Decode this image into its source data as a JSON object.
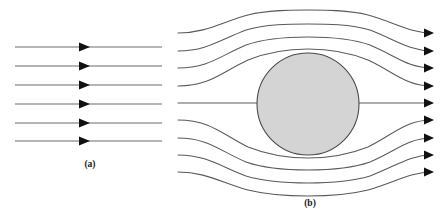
{
  "figure": {
    "background_color": "#ffffff",
    "width": 448,
    "height": 213
  },
  "panel_a": {
    "caption": "(a)",
    "caption_x": 90,
    "caption_y": 167,
    "description": "Uniform parallel streamlines flowing to the right",
    "line_color": "#6a6a6a",
    "arrow_color": "#111111",
    "arrow_direction": "right",
    "line_start_x": 15,
    "line_end_x": 162,
    "arrow_x": 85,
    "streamline_y": [
      47,
      66,
      85,
      104,
      123,
      141
    ],
    "streamline_count": 6
  },
  "panel_b": {
    "caption": "(b)",
    "caption_x": 310,
    "caption_y": 200,
    "description": "Streamlines deflected around a solid sphere, arrows at right pointing left",
    "line_color": "#5a5a5a",
    "arrow_color": "#111111",
    "arrow_direction": "left",
    "line_start_x": 178,
    "line_end_x": 432,
    "arrow_x": 432,
    "streamline_count": 9,
    "sphere": {
      "name": "sphere",
      "center_x": 308,
      "center_y": 104,
      "radius": 51,
      "fill_color": "#d4d4d4",
      "stroke_color": "#4a4a4a"
    },
    "streamlines": [
      {
        "inlet_y": 33,
        "outlet_y": 33,
        "apex_y": 12,
        "side": "upper"
      },
      {
        "inlet_y": 51,
        "outlet_y": 51,
        "apex_y": 26,
        "side": "upper"
      },
      {
        "inlet_y": 68,
        "outlet_y": 68,
        "apex_y": 39,
        "side": "upper"
      },
      {
        "inlet_y": 86,
        "outlet_y": 86,
        "apex_y": 50,
        "side": "upper"
      },
      {
        "inlet_y": 103,
        "outlet_y": 103,
        "apex_y": 103,
        "side": "center"
      },
      {
        "inlet_y": 120,
        "outlet_y": 120,
        "apex_y": 157,
        "side": "lower"
      },
      {
        "inlet_y": 138,
        "outlet_y": 138,
        "apex_y": 168,
        "side": "lower"
      },
      {
        "inlet_y": 155,
        "outlet_y": 155,
        "apex_y": 181,
        "side": "lower"
      },
      {
        "inlet_y": 172,
        "outlet_y": 172,
        "apex_y": 194,
        "side": "lower"
      }
    ]
  }
}
